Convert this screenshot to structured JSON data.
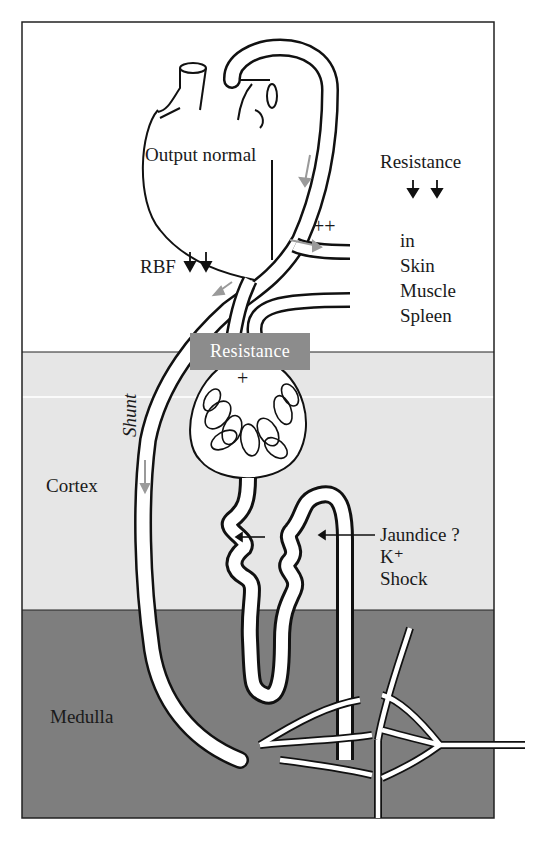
{
  "diagram": {
    "regions": {
      "top": {
        "label": "",
        "color": "#ffffff"
      },
      "cortex": {
        "label": "Cortex",
        "color": "#e6e6e6"
      },
      "medulla": {
        "label": "Medulla",
        "color": "#7e7e7e"
      }
    },
    "labels": {
      "heart_output": "Output normal",
      "systemic_resistance": "Resistance",
      "systemic_resistance_arrows": "↓↓",
      "vasoconstriction_marker": "++",
      "organs_in": "in",
      "organs": [
        "Skin",
        "Muscle",
        "Spleen"
      ],
      "rbf": "RBF",
      "rbf_arrows": "↓↓",
      "afferent_resistance": "Resistance",
      "glomerular_marker": "+",
      "shunt": "Shunt",
      "cortex": "Cortex",
      "medulla": "Medulla",
      "tubular_factors": [
        "Jaundice ?",
        "K⁺",
        "Shock"
      ]
    },
    "colors": {
      "outline": "#111111",
      "vessel_fill": "#ffffff",
      "flow_arrow": "#9a9a9a",
      "resistance_box": "#8c8c8c",
      "cortex_bg": "#e6e6e6",
      "medulla_bg": "#7e7e7e"
    }
  }
}
